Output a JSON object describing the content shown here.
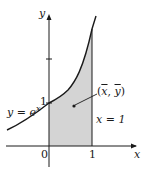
{
  "figure": {
    "axes": {
      "x_label": "x",
      "y_label": "y",
      "x_ticks": [
        {
          "value": 0,
          "label": "0"
        },
        {
          "value": 1,
          "label": "1"
        }
      ],
      "y_ticks": [
        {
          "value": 1,
          "label": "1"
        },
        {
          "value": 2,
          "label": ""
        }
      ]
    },
    "curve": {
      "equation_label_lhs": "y = e",
      "equation_label_exp": "x",
      "function": "e^x"
    },
    "vertical_line": {
      "label": "x = 1"
    },
    "shaded_region": {
      "from": 0,
      "to": 1,
      "fill": "#d4d4d4"
    },
    "centroid": {
      "label_open": "(",
      "label_x": "x",
      "label_sep": ", ",
      "label_y": "y",
      "label_close": ")"
    },
    "colors": {
      "ink": "#1a1a1a",
      "shade": "#d4d4d4",
      "background": "#ffffff"
    }
  }
}
